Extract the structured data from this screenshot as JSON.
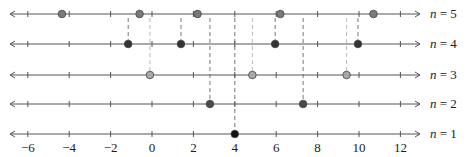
{
  "diagram": {
    "type": "number-line-stack",
    "x_axis": {
      "min": -6,
      "max": 12,
      "ticks": [
        -6,
        -4,
        -2,
        0,
        2,
        4,
        6,
        8,
        10,
        12
      ],
      "tick_labels": [
        "−6",
        "−4",
        "−2",
        "0",
        "2",
        "4",
        "6",
        "8",
        "10",
        "12"
      ],
      "minor_step": 1
    },
    "rows": [
      {
        "label_var": "n",
        "label_eq": " = 5",
        "n": 5,
        "points": [
          -4.35,
          -0.6,
          2.2,
          6.2,
          10.7
        ],
        "color": "#7a7a7a"
      },
      {
        "label_var": "n",
        "label_eq": " = 4",
        "n": 4,
        "points": [
          -1.15,
          1.4,
          5.95,
          9.95
        ],
        "color": "#333333"
      },
      {
        "label_var": "n",
        "label_eq": " = 3",
        "n": 3,
        "points": [
          -0.1,
          4.85,
          9.4
        ],
        "color": "#a8a8a8"
      },
      {
        "label_var": "n",
        "label_eq": " = 2",
        "n": 2,
        "points": [
          2.8,
          7.3
        ],
        "color": "#4a4a4a"
      },
      {
        "label_var": "n",
        "label_eq": " = 1",
        "n": 1,
        "points": [
          4.0
        ],
        "color": "#111111"
      }
    ],
    "dashed_guides": "vertical dashed lines from each point in rows n=1..4 up to row n=5",
    "colors": {
      "axis": "#555555",
      "dash_dark": "#777777",
      "dash_light": "#bbbbbb"
    }
  }
}
